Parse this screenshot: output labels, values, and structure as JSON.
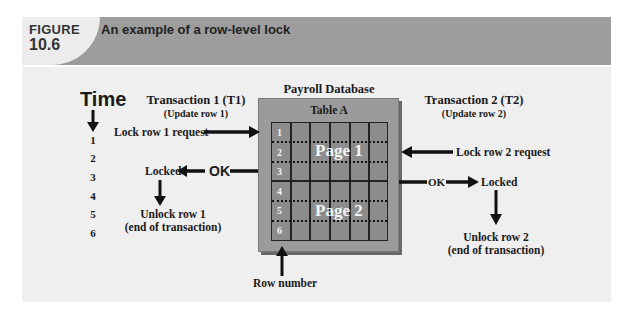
{
  "figure": {
    "label": "FIGURE",
    "number": "10.6",
    "title": "An example of a row-level lock"
  },
  "timeline": {
    "label": "Time",
    "ticks": [
      "1",
      "2",
      "3",
      "4",
      "5",
      "6"
    ]
  },
  "transaction1": {
    "title": "Transaction 1 (T1)",
    "subtitle": "(Update row 1)",
    "request": "Lock row 1 request",
    "ok": "OK",
    "locked": "Locked",
    "unlock_line1": "Unlock row 1",
    "unlock_line2": "(end of transaction)"
  },
  "database": {
    "title": "Payroll Database",
    "table_label": "Table A",
    "rows": [
      "1",
      "2",
      "3",
      "4",
      "5",
      "6"
    ],
    "columns": 6,
    "pages": [
      {
        "label": "Page 1",
        "rows": [
          "1",
          "2",
          "3"
        ]
      },
      {
        "label": "Page 2",
        "rows": [
          "4",
          "5",
          "6"
        ]
      }
    ],
    "row_number_label": "Row number"
  },
  "transaction2": {
    "title": "Transaction 2 (T2)",
    "subtitle": "(Update row 2)",
    "request": "Lock row 2 request",
    "ok": "OK",
    "locked": "Locked",
    "unlock_line1": "Unlock row 2",
    "unlock_line2": "(end of transaction)"
  },
  "colors": {
    "header_band": "#9d9d9d",
    "panel": "#efefef",
    "db_box": "#9b9b9b",
    "grid_fill": "#8c8c8c"
  }
}
